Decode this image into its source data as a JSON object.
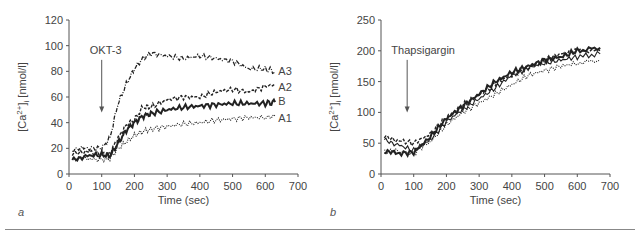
{
  "chart_data": [
    {
      "panel": "a",
      "type": "line",
      "title": "",
      "xlabel": "Time (sec)",
      "ylabel": "[Ca2+]i [nmol/l]",
      "xlim": [
        0,
        700
      ],
      "ylim": [
        0,
        120
      ],
      "xticks": [
        0,
        100,
        200,
        300,
        400,
        500,
        600,
        700
      ],
      "yticks": [
        0,
        20,
        40,
        60,
        80,
        100,
        120
      ],
      "annotation": {
        "text": "OKT-3",
        "x": 100,
        "arrow_to_y": 48
      },
      "grid": false,
      "x": [
        10,
        50,
        100,
        125,
        150,
        175,
        200,
        225,
        250,
        300,
        350,
        400,
        450,
        500,
        550,
        600,
        630
      ],
      "series": [
        {
          "name": "A3",
          "style": "dash-dot",
          "values": [
            18,
            20,
            20,
            28,
            55,
            70,
            82,
            90,
            94,
            92,
            90,
            92,
            90,
            88,
            82,
            82,
            80
          ]
        },
        {
          "name": "A2",
          "style": "dashed",
          "values": [
            15,
            18,
            15,
            16,
            28,
            38,
            42,
            52,
            52,
            58,
            60,
            60,
            64,
            66,
            64,
            68,
            70
          ]
        },
        {
          "name": "B",
          "style": "solid-bold",
          "values": [
            12,
            14,
            15,
            14,
            24,
            34,
            40,
            45,
            47,
            50,
            52,
            53,
            54,
            55,
            55,
            55,
            56
          ]
        },
        {
          "name": "A1",
          "style": "dotted",
          "values": [
            12,
            12,
            11,
            12,
            20,
            25,
            30,
            33,
            35,
            37,
            39,
            40,
            42,
            43,
            44,
            44,
            45
          ]
        }
      ]
    },
    {
      "panel": "b",
      "type": "line",
      "title": "",
      "xlabel": "Time (sec)",
      "ylabel": "[Ca2+]i [nmol/l]",
      "xlim": [
        0,
        700
      ],
      "ylim": [
        0,
        250
      ],
      "xticks": [
        0,
        100,
        200,
        300,
        400,
        500,
        600,
        700
      ],
      "yticks": [
        0,
        50,
        100,
        150,
        200,
        250
      ],
      "annotation": {
        "text": "Thapsigargin",
        "x": 80,
        "arrow_to_y": 100
      },
      "grid": false,
      "x": [
        10,
        50,
        100,
        150,
        200,
        250,
        300,
        350,
        400,
        450,
        500,
        550,
        600,
        670
      ],
      "series": [
        {
          "name": "trace1",
          "style": "solid-bold",
          "values": [
            35,
            33,
            35,
            60,
            90,
            110,
            130,
            150,
            165,
            175,
            185,
            190,
            200,
            205
          ]
        },
        {
          "name": "trace2",
          "style": "dashed",
          "values": [
            60,
            55,
            50,
            65,
            92,
            112,
            128,
            148,
            160,
            172,
            185,
            195,
            200,
            200
          ]
        },
        {
          "name": "trace3",
          "style": "solid",
          "values": [
            58,
            48,
            38,
            55,
            85,
            105,
            122,
            140,
            160,
            172,
            180,
            185,
            190,
            195
          ]
        },
        {
          "name": "trace4",
          "style": "dotted",
          "values": [
            38,
            36,
            34,
            52,
            80,
            100,
            115,
            130,
            145,
            160,
            168,
            175,
            180,
            185
          ]
        }
      ]
    }
  ],
  "labels": {
    "a": {
      "ylabel_main": "[Ca",
      "ylabel_sup": "2+",
      "ylabel_rest": "]",
      "ylabel_sub": "i",
      "ylabel_unit": " [nmol/l]",
      "xlabel": "Time (sec)",
      "annotation": "OKT-3",
      "panel": "a",
      "series_labels": [
        "A3",
        "A2",
        "B",
        "A1"
      ]
    },
    "b": {
      "ylabel_main": "[Ca",
      "ylabel_sup": "2+",
      "ylabel_rest": "]",
      "ylabel_sub": "i",
      "ylabel_unit": " [nmol/l]",
      "xlabel": "Time (sec)",
      "annotation": "Thapsigargin",
      "panel": "b"
    }
  },
  "colors": {
    "axis": "#555555",
    "line": "#222222",
    "text": "#444444"
  }
}
